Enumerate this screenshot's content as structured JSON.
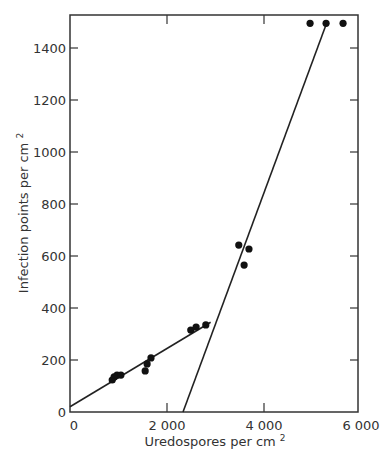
{
  "chart_data": {
    "type": "scatter",
    "title": "",
    "xlabel": "Uredospores per cm²",
    "ylabel": "Infection points per cm²",
    "xlabel_base": "Uredospores per cm",
    "ylabel_base": "Infection points per cm",
    "label_superscript": "2",
    "xlim": [
      0,
      6000
    ],
    "ylim": [
      0,
      1550
    ],
    "x_ticks": [
      0,
      2000,
      4000,
      6000
    ],
    "x_tick_labels": [
      "0",
      "2 000",
      "4 000",
      "6 000"
    ],
    "y_ticks": [
      0,
      200,
      400,
      600,
      800,
      1000,
      1200,
      1400
    ],
    "y_tick_labels": [
      "0",
      "200",
      "400",
      "600",
      "800",
      "1000",
      "1200",
      "1400"
    ],
    "grid": false,
    "legend": null,
    "series": [
      {
        "name": "observations",
        "x": [
          870,
          910,
          970,
          1050,
          1550,
          1590,
          1670,
          2490,
          2600,
          2800,
          3480,
          3590,
          3690,
          4950,
          5280,
          5630
        ],
        "y": [
          123,
          135,
          142,
          142,
          158,
          185,
          208,
          315,
          327,
          335,
          642,
          565,
          627,
          1495,
          1495,
          1495
        ]
      }
    ],
    "fit_lines": [
      {
        "name": "low-density fit",
        "x": [
          0,
          2900
        ],
        "y": [
          20,
          345
        ]
      },
      {
        "name": "high-density fit",
        "x": [
          2330,
          5300
        ],
        "y": [
          0,
          1500
        ]
      }
    ]
  }
}
